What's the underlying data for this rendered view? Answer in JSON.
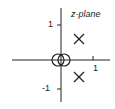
{
  "diagram": {
    "title": "z-plane",
    "axis_ticks": {
      "y_pos": "1",
      "y_neg": "-1",
      "x_pos": "1"
    },
    "zeros": [
      {
        "re": 0,
        "im": 0,
        "order": 2
      }
    ],
    "poles": [
      {
        "re": 0.5,
        "im": 0.5
      },
      {
        "re": 0.5,
        "im": -0.5
      }
    ],
    "colors": {
      "stroke": "#222222",
      "background": "#ffffff"
    }
  }
}
